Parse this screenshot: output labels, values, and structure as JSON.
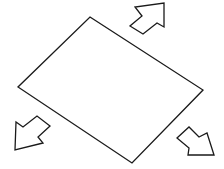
{
  "diagram": {
    "stroke_color": "#1a1a1a",
    "background": "#ffffff",
    "rectangle": {
      "points": [
        [
          90,
          17
        ],
        [
          203,
          90
        ],
        [
          132,
          163
        ],
        [
          18,
          87
        ]
      ]
    },
    "arrows": [
      {
        "direction": "up-right",
        "points": [
          [
            164,
            3
          ],
          [
            164,
            27
          ],
          [
            157,
            23
          ],
          [
            143,
            34
          ],
          [
            130,
            26
          ],
          [
            142,
            16
          ],
          [
            135,
            7
          ]
        ]
      },
      {
        "direction": "down-left",
        "points": [
          [
            15,
            150
          ],
          [
            16,
            122
          ],
          [
            23,
            127
          ],
          [
            37,
            116
          ],
          [
            50,
            126
          ],
          [
            38,
            137
          ],
          [
            43,
            143
          ]
        ]
      },
      {
        "direction": "down-right",
        "points": [
          [
            214,
            155
          ],
          [
            207,
            133
          ],
          [
            199,
            137
          ],
          [
            189,
            127
          ],
          [
            177,
            138
          ],
          [
            189,
            148
          ],
          [
            188,
            155
          ]
        ]
      }
    ]
  }
}
